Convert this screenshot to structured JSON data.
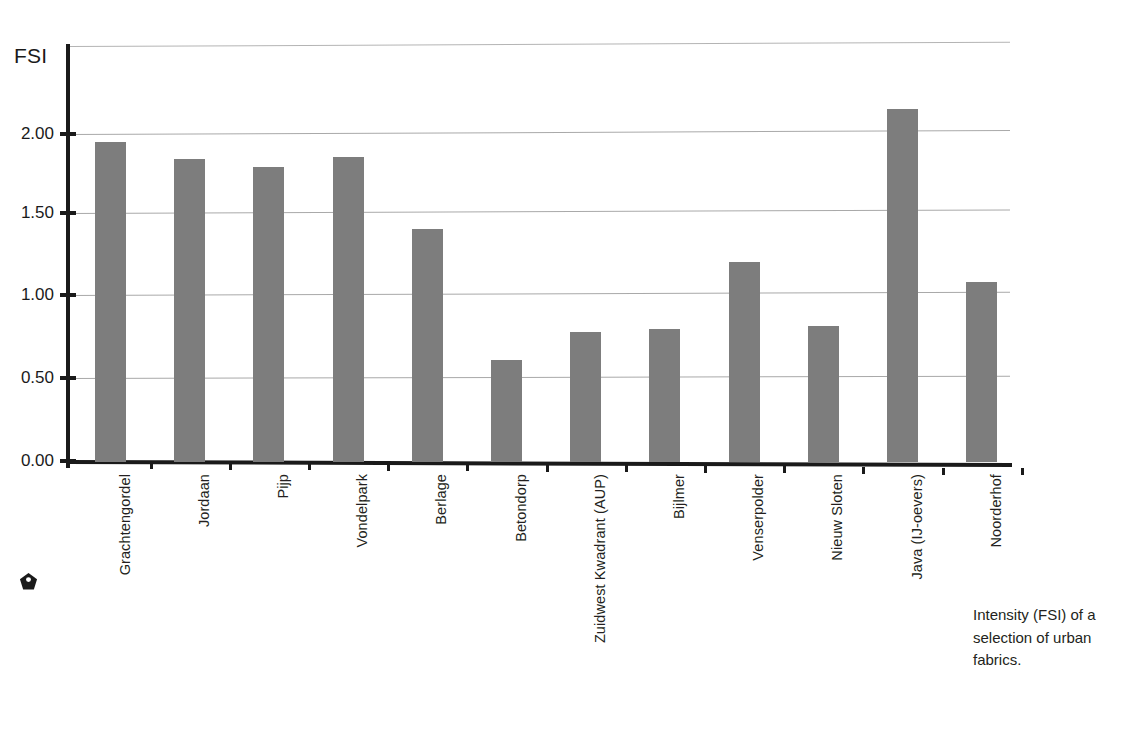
{
  "chart_data": {
    "type": "bar",
    "title": "",
    "ylabel": "FSI",
    "xlabel": "",
    "ylim": [
      0.0,
      2.5
    ],
    "grid": true,
    "legend": "none",
    "y_ticks": [
      "0.00",
      "0.50",
      "1.00",
      "1.50",
      "2.00"
    ],
    "y_tick_values": [
      0.0,
      0.5,
      1.0,
      1.5,
      2.0
    ],
    "categories": [
      "Grachtengordel",
      "Jordaan",
      "Pijp",
      "Vondelpark",
      "Berlage",
      "Betondorp",
      "Zuidwest Kwadrant (AUP)",
      "Bijlmer",
      "Venserpolder",
      "Nieuw Sloten",
      "Java (IJ-oevers)",
      "Noorderhof"
    ],
    "values": [
      1.95,
      1.85,
      1.8,
      1.86,
      1.42,
      0.62,
      0.79,
      0.81,
      1.22,
      0.83,
      2.15,
      1.1
    ],
    "bar_color": "#7d7d7d",
    "axis_color": "#1a1a1a",
    "grid_color": "#a9a9a9"
  },
  "axis": {
    "y_title": "FSI"
  },
  "caption": {
    "text": "Intensity (FSI) of a selection of urban fabrics."
  },
  "marker": {
    "name": "pentagon-bullet"
  }
}
